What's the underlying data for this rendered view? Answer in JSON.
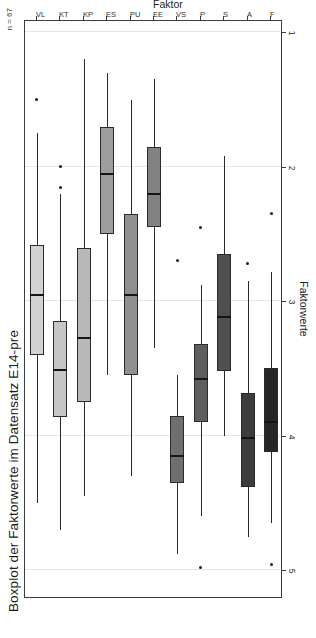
{
  "chart_data": {
    "type": "box",
    "title": "Boxplot der Faktorwerte im Datensatz E14-pre",
    "xlabel": "Faktor",
    "ylabel": "Faktorwerte",
    "annotation": "n = 67",
    "orientation": "horizontal",
    "grid": true,
    "value_axis_ticks": [
      "5",
      "4",
      "3",
      "2",
      "1"
    ],
    "value_axis_tick_values": [
      5,
      4,
      3,
      2,
      1
    ],
    "ylim": [
      5.2,
      0.9
    ],
    "category_axis_label": "Faktor",
    "categories": [
      "VL",
      "KT",
      "KP",
      "ES",
      "PU",
      "EE",
      "VS",
      "P",
      "S",
      "A",
      "F"
    ],
    "legend_position": "none",
    "boxes": [
      {
        "category": "VL",
        "min_whisker": 4.5,
        "q1": 3.4,
        "median": 2.95,
        "q3": 2.58,
        "max_whisker": 1.75,
        "outliers": [
          1.5
        ],
        "fill": "#d3d3d3"
      },
      {
        "category": "KT",
        "min_whisker": 4.7,
        "q1": 3.86,
        "median": 3.51,
        "q3": 3.15,
        "max_whisker": 2.2,
        "outliers": [
          2.15,
          2.0
        ],
        "fill": "#c6c6c6"
      },
      {
        "category": "KP",
        "min_whisker": 4.45,
        "q1": 3.75,
        "median": 3.27,
        "q3": 2.6,
        "max_whisker": 1.2,
        "outliers": [],
        "fill": "#b8b8b8"
      },
      {
        "category": "ES",
        "min_whisker": 3.55,
        "q1": 2.5,
        "median": 2.05,
        "q3": 1.7,
        "max_whisker": 1.3,
        "outliers": [],
        "fill": "#9d9d9d"
      },
      {
        "category": "PU",
        "min_whisker": 4.3,
        "q1": 3.55,
        "median": 2.95,
        "q3": 2.35,
        "max_whisker": 1.5,
        "outliers": [],
        "fill": "#8f8f8f"
      },
      {
        "category": "EE",
        "min_whisker": 3.35,
        "q1": 2.45,
        "median": 2.2,
        "q3": 1.85,
        "max_whisker": 1.35,
        "outliers": [],
        "fill": "#818181"
      },
      {
        "category": "VS",
        "min_whisker": 4.88,
        "q1": 4.35,
        "median": 4.15,
        "q3": 3.85,
        "max_whisker": 3.55,
        "outliers": [
          2.7
        ],
        "fill": "#6f6f6f"
      },
      {
        "category": "P",
        "min_whisker": 4.6,
        "q1": 3.9,
        "median": 3.58,
        "q3": 3.32,
        "max_whisker": 2.88,
        "outliers": [
          4.98,
          2.45
        ],
        "fill": "#5e5e5e"
      },
      {
        "category": "S",
        "min_whisker": 4.0,
        "q1": 3.52,
        "median": 3.12,
        "q3": 2.65,
        "max_whisker": 1.92,
        "outliers": [],
        "fill": "#4f4f4f"
      },
      {
        "category": "A",
        "min_whisker": 4.75,
        "q1": 4.38,
        "median": 4.02,
        "q3": 3.68,
        "max_whisker": 2.85,
        "outliers": [
          2.72
        ],
        "fill": "#3c3c3c"
      },
      {
        "category": "F",
        "min_whisker": 4.65,
        "q1": 4.12,
        "median": 3.9,
        "q3": 3.5,
        "max_whisker": 2.78,
        "outliers": [
          4.96,
          2.35
        ],
        "fill": "#262626"
      }
    ]
  },
  "colors": {
    "frame": "#3c3c3c",
    "grid": "#e6e6e6",
    "ink": "#1f1f1f",
    "background": "#ffffff"
  }
}
